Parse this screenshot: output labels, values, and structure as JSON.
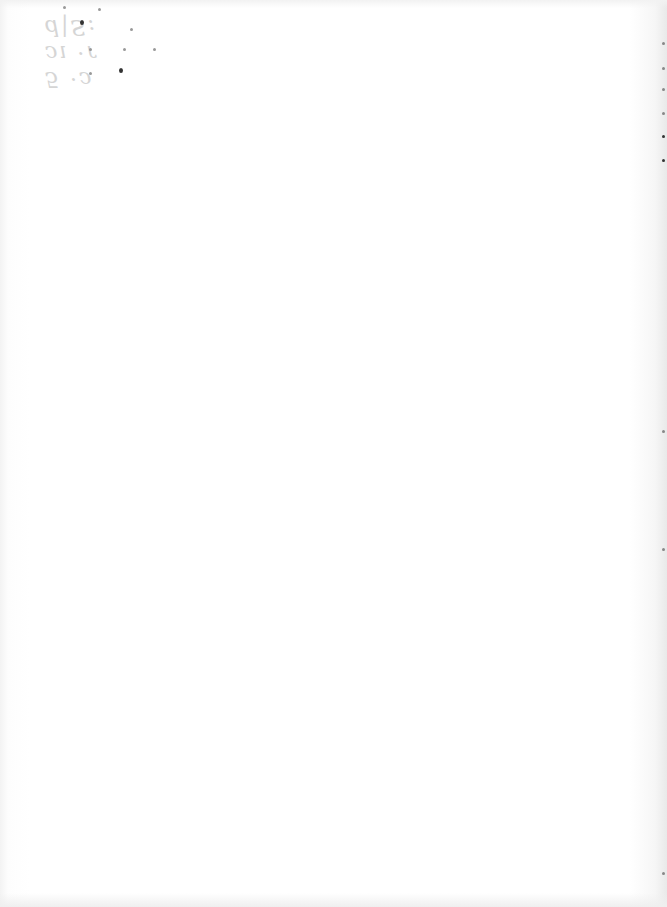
{
  "page": {
    "type": "scanned-blank-page",
    "bleed_through_text": [
      "5 ·ɔ",
      "ɔı ·ɾ",
      "d|S:"
    ],
    "background_color": "#ffffff"
  }
}
